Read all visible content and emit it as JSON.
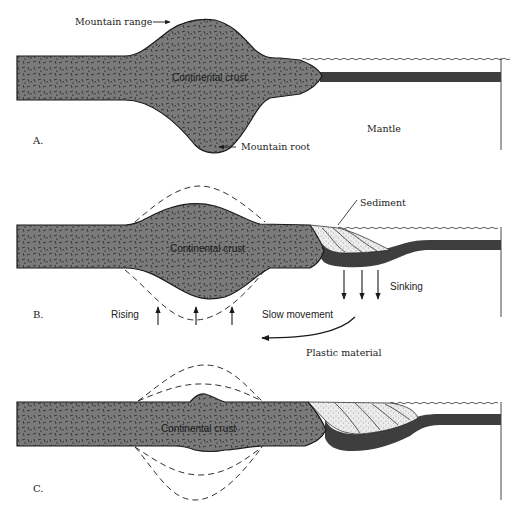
{
  "figure": {
    "colors": {
      "continental_crust": "#7a7a7a",
      "oceanic_crust": "#3e3e3e",
      "sediment": "#e8e8e8",
      "outline": "#1a1a1a",
      "background": "#ffffff"
    },
    "panels": [
      {
        "id": "A",
        "label": "A.",
        "crust_label": "Continental crust",
        "annotations": {
          "mountain_range": "Mountain range",
          "mountain_root": "Mountain root",
          "mantle": "Mantle"
        }
      },
      {
        "id": "B",
        "label": "B.",
        "crust_label": "Continental crust",
        "annotations": {
          "sediment": "Sediment",
          "sinking": "Sinking",
          "rising": "Rising",
          "slow_movement": "Slow movement",
          "plastic_material": "Plastic material"
        }
      },
      {
        "id": "C",
        "label": "C.",
        "crust_label": "Continental crust"
      }
    ]
  }
}
